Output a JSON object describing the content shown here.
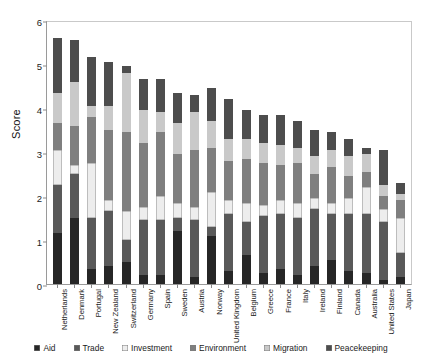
{
  "chart_data": {
    "type": "bar",
    "subtype": "stacked-vertical",
    "title": "",
    "xlabel": "",
    "ylabel": "Score",
    "ylim": [
      0,
      6
    ],
    "yticks": [
      0,
      1,
      2,
      3,
      4,
      5,
      6
    ],
    "ytick_labels": [
      "0",
      "1",
      "2",
      "3",
      "4",
      "5",
      "6"
    ],
    "grid": false,
    "legend_position": "bottom",
    "categories": [
      "Netherlands",
      "Denmark",
      "Portugal",
      "New Zealand",
      "Switzerland",
      "Germany",
      "Spain",
      "Sweden",
      "Austria",
      "Norway",
      "United Kingdom",
      "Belgium",
      "Greece",
      "France",
      "Italy",
      "Ireland",
      "Finland",
      "Canada",
      "Australia",
      "United States",
      "Japan"
    ],
    "series": [
      {
        "name": "Aid",
        "color": "#262626",
        "values": [
          1.15,
          1.5,
          0.35,
          0.4,
          0.5,
          0.2,
          0.2,
          1.2,
          0.15,
          1.1,
          0.3,
          0.65,
          0.25,
          0.35,
          0.2,
          0.4,
          0.55,
          0.3,
          0.25,
          0.1,
          0.15
        ]
      },
      {
        "name": "Trade",
        "color": "#595959",
        "values": [
          1.1,
          1.0,
          1.15,
          1.25,
          0.5,
          1.25,
          1.25,
          0.3,
          1.3,
          0.2,
          1.3,
          0.75,
          1.3,
          1.25,
          1.3,
          1.3,
          1.05,
          1.3,
          1.35,
          1.3,
          0.55
        ]
      },
      {
        "name": "Investment",
        "color": "#ededed",
        "values": [
          0.8,
          0.2,
          1.25,
          0.25,
          0.65,
          0.3,
          0.55,
          0.35,
          0.3,
          0.8,
          0.3,
          0.45,
          0.25,
          0.3,
          0.35,
          0.25,
          0.25,
          0.35,
          0.6,
          0.3,
          0.8
        ]
      },
      {
        "name": "Environment",
        "color": "#7f7f7f",
        "values": [
          0.6,
          0.9,
          1.05,
          1.6,
          1.8,
          1.45,
          1.45,
          1.1,
          1.3,
          1.0,
          0.9,
          1.0,
          0.95,
          0.8,
          0.9,
          0.55,
          0.8,
          0.5,
          0.35,
          0.3,
          0.4
        ]
      },
      {
        "name": "Migration",
        "color": "#c9c9c9",
        "values": [
          0.7,
          1.0,
          0.25,
          0.55,
          1.35,
          0.75,
          0.45,
          0.7,
          0.85,
          0.6,
          0.5,
          0.45,
          0.45,
          0.45,
          0.35,
          0.4,
          0.4,
          0.45,
          0.4,
          0.25,
          0.15
        ]
      },
      {
        "name": "Peacekeeping",
        "color": "#4d4d4d",
        "values": [
          1.25,
          0.95,
          1.1,
          1.0,
          0.15,
          0.7,
          0.75,
          0.7,
          0.4,
          0.75,
          0.9,
          0.65,
          0.65,
          0.7,
          0.6,
          0.6,
          0.4,
          0.4,
          0.15,
          0.8,
          0.25
        ]
      }
    ],
    "totals": [
      5.6,
      5.55,
      5.15,
      5.05,
      4.95,
      4.65,
      4.65,
      4.35,
      4.3,
      4.45,
      4.2,
      3.95,
      3.85,
      3.85,
      3.7,
      3.5,
      3.45,
      3.3,
      3.1,
      3.05,
      2.3
    ]
  },
  "legend": {
    "items": [
      {
        "label": "Aid",
        "color": "#262626"
      },
      {
        "label": "Trade",
        "color": "#595959"
      },
      {
        "label": "Investment",
        "color": "#ededed"
      },
      {
        "label": "Environment",
        "color": "#7f7f7f"
      },
      {
        "label": "Migration",
        "color": "#c9c9c9"
      },
      {
        "label": "Peacekeeping",
        "color": "#4d4d4d"
      }
    ]
  }
}
